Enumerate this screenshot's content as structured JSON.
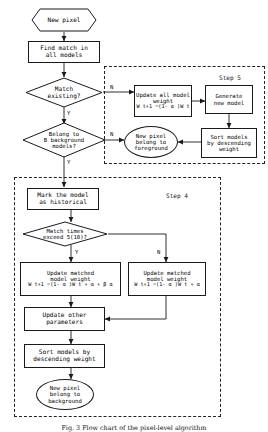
{
  "figure": {
    "type": "flowchart",
    "caption": "Fig. 3  Flow chart of the pixel-level algorithm"
  },
  "groups": [
    {
      "id": "step5",
      "label": "Step 5"
    },
    {
      "id": "step4",
      "label": "Step 4"
    }
  ],
  "nodes": {
    "new_pixel": {
      "shape": "hexagon",
      "text": "New pixel"
    },
    "find_match": {
      "shape": "rect",
      "line1": "Find match in",
      "line2": "all models"
    },
    "match_existing": {
      "shape": "diamond",
      "line1": "Match",
      "line2": "existing?"
    },
    "belong_b": {
      "shape": "diamond",
      "line1": "Belong to",
      "line2": "B background",
      "line3": "models?"
    },
    "update_all": {
      "shape": "rect",
      "line1": "Update all model",
      "line2": "weight",
      "formula": "W t+1 =(1- α )W t"
    },
    "generate_new": {
      "shape": "rect",
      "line1": "Generate",
      "line2": "new model"
    },
    "sort_desc_top": {
      "shape": "rect",
      "line1": "Sort models",
      "line2": "by descending",
      "line3": "weight"
    },
    "pixel_foreground": {
      "shape": "ellipse",
      "line1": "New pixel",
      "line2": "belong to",
      "line3": "foreground"
    },
    "mark_historical": {
      "shape": "rect",
      "line1": "Mark the model",
      "line2": "as historical"
    },
    "match_times": {
      "shape": "diamond",
      "line1": "Match times",
      "line2": "exceed 5(10)?"
    },
    "update_matched_y": {
      "shape": "rect",
      "line1": "Update matched",
      "line2": "model weight",
      "formula": "W t+1 =(1- α )W t + α + β α"
    },
    "update_matched_n": {
      "shape": "rect",
      "line1": "Update matched",
      "line2": "model weight",
      "formula": "W t+1 =(1- α )W t + α"
    },
    "update_other": {
      "shape": "rect",
      "line1": "Update other",
      "line2": "parameters"
    },
    "sort_desc_bottom": {
      "shape": "rect",
      "line1": "Sort models by",
      "line2": "descending weight"
    },
    "pixel_background": {
      "shape": "ellipse",
      "line1": "New pixel",
      "line2": "belong to",
      "line3": "background"
    }
  },
  "edge_labels": {
    "match_existing_n": "N",
    "match_existing_y": "Y",
    "belong_b_n": "N",
    "belong_b_y": "Y",
    "match_times_y": "Y",
    "match_times_n": "N"
  },
  "colors": {
    "stroke": "#1a1a1a",
    "dashed": "#222222",
    "background": "#ffffff"
  }
}
